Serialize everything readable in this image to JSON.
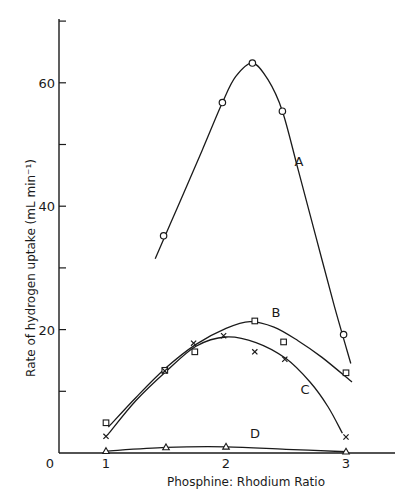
{
  "chart_data": {
    "type": "scatter",
    "title": "",
    "xlabel": "Phosphine: Rhodium Ratio",
    "ylabel": "Rate of hydrogen uptake (mL min⁻¹)",
    "xlim": [
      0.6,
      3.45
    ],
    "ylim": [
      0,
      70
    ],
    "x_ticks": [
      1,
      2,
      3
    ],
    "x_tick_labels": [
      "1",
      "2",
      "3"
    ],
    "y_ticks": [
      10,
      20,
      30,
      40,
      50,
      60,
      70
    ],
    "y_tick_labels": [
      "",
      "20",
      "",
      "40",
      "",
      "60",
      ""
    ],
    "origin_label": "0",
    "grid": false,
    "legend": "curve labels placed inline (A, B, C, D)",
    "series": [
      {
        "name": "A",
        "marker": "circle",
        "points": [
          [
            1.48,
            35.2
          ],
          [
            1.97,
            56.8
          ],
          [
            2.22,
            63.2
          ],
          [
            2.47,
            55.4
          ],
          [
            2.98,
            19.2
          ]
        ],
        "curve": [
          [
            1.41,
            31.5
          ],
          [
            1.6,
            40
          ],
          [
            1.8,
            49
          ],
          [
            1.97,
            56.8
          ],
          [
            2.08,
            61
          ],
          [
            2.22,
            63.2
          ],
          [
            2.35,
            60.5
          ],
          [
            2.47,
            55.4
          ],
          [
            2.6,
            46
          ],
          [
            2.75,
            35
          ],
          [
            2.9,
            24
          ],
          [
            3.04,
            14.5
          ]
        ],
        "label_pos": [
          2.57,
          46.5
        ]
      },
      {
        "name": "B",
        "marker": "square",
        "points": [
          [
            1.0,
            4.9
          ],
          [
            1.49,
            13.4
          ],
          [
            1.74,
            16.4
          ],
          [
            2.24,
            21.4
          ],
          [
            2.48,
            18.0
          ],
          [
            3.0,
            13.0
          ]
        ],
        "curve": [
          [
            1.02,
            4.2
          ],
          [
            1.25,
            9
          ],
          [
            1.5,
            13.8
          ],
          [
            1.75,
            17.6
          ],
          [
            2.0,
            20.2
          ],
          [
            2.2,
            21.3
          ],
          [
            2.4,
            20.4
          ],
          [
            2.6,
            18.2
          ],
          [
            2.8,
            15.5
          ],
          [
            3.05,
            11.5
          ]
        ],
        "label_pos": [
          2.38,
          22.0
        ]
      },
      {
        "name": "C",
        "marker": "cross",
        "points": [
          [
            1.0,
            2.7
          ],
          [
            1.49,
            13.3
          ],
          [
            1.73,
            17.8
          ],
          [
            1.98,
            19.0
          ],
          [
            2.24,
            16.4
          ],
          [
            2.49,
            15.2
          ],
          [
            3.0,
            2.6
          ]
        ],
        "curve": [
          [
            1.02,
            3.1
          ],
          [
            1.25,
            8.5
          ],
          [
            1.5,
            13.2
          ],
          [
            1.75,
            17.3
          ],
          [
            2.0,
            18.8
          ],
          [
            2.25,
            17.9
          ],
          [
            2.5,
            15.3
          ],
          [
            2.7,
            11.5
          ],
          [
            2.85,
            7.5
          ],
          [
            2.97,
            3.2
          ]
        ],
        "label_pos": [
          2.62,
          9.6
        ]
      },
      {
        "name": "D",
        "marker": "triangle",
        "points": [
          [
            1.0,
            0.3
          ],
          [
            1.5,
            0.9
          ],
          [
            2.0,
            1.0
          ],
          [
            3.0,
            0.2
          ]
        ],
        "curve": [
          [
            1.0,
            0.3
          ],
          [
            1.5,
            0.9
          ],
          [
            2.0,
            1.0
          ],
          [
            2.5,
            0.6
          ],
          [
            3.0,
            0.2
          ]
        ],
        "label_pos": [
          2.2,
          2.4
        ]
      }
    ]
  },
  "header_fragment": "Coordination Chemistry"
}
